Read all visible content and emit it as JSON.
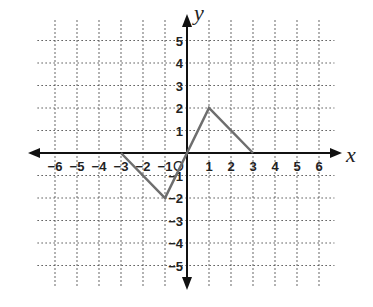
{
  "chart_data": {
    "type": "line",
    "title": "",
    "xlabel": "x",
    "ylabel": "y",
    "xlim": [
      -6,
      6
    ],
    "ylim": [
      -5,
      5
    ],
    "grid": true,
    "x_ticks": [
      "-6",
      "-5",
      "-4",
      "-3",
      "-2",
      "-1",
      "1",
      "2",
      "3",
      "4",
      "5",
      "6"
    ],
    "y_ticks": [
      "5",
      "4",
      "3",
      "2",
      "1",
      "-1",
      "-2",
      "-3",
      "-4",
      "-5"
    ],
    "origin_label": "O",
    "series": [
      {
        "name": "f(x)",
        "x": [
          -3,
          -1,
          0,
          1,
          3
        ],
        "y": [
          0,
          -2,
          0,
          2,
          0
        ],
        "color": "#6e6e6e"
      }
    ]
  }
}
